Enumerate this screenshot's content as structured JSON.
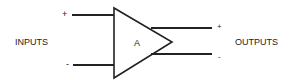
{
  "diagram": {
    "type": "differential amplifier block",
    "amplifier_label": "A",
    "inputs_label": "INPUTS",
    "outputs_label": "OUTPUTS",
    "input_pins": [
      {
        "sign": "+"
      },
      {
        "sign": "-"
      }
    ],
    "output_pins": [
      {
        "sign": "+"
      },
      {
        "sign": "-"
      }
    ],
    "colors": {
      "stroke": "#222222",
      "background": "#ffffff"
    }
  }
}
